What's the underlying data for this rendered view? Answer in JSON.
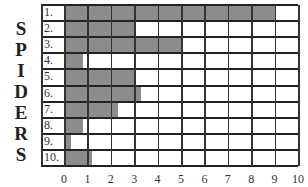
{
  "chart_data": {
    "type": "bar",
    "orientation": "horizontal",
    "title": "SPIDERS",
    "ylabel": "SPIDERS",
    "xlabel": "",
    "categories": [
      "1.",
      "2.",
      "3.",
      "4.",
      "5.",
      "6.",
      "7.",
      "8.",
      "9.",
      "10."
    ],
    "values": [
      9,
      3,
      5,
      0.8,
      3,
      3.3,
      2.3,
      0.8,
      0.3,
      1.2
    ],
    "xlim": [
      0,
      10
    ],
    "xticks": [
      "0",
      "1",
      "2",
      "3",
      "4",
      "5",
      "6",
      "7",
      "8",
      "9",
      "10"
    ],
    "grid": true,
    "bar_color": "#8c8c8c"
  },
  "vertical_label": [
    "S",
    "P",
    "I",
    "D",
    "E",
    "R",
    "S"
  ]
}
